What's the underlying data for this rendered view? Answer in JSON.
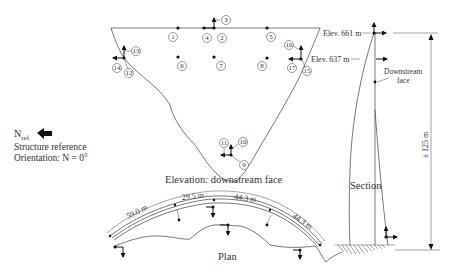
{
  "elevation": {
    "caption": "Elevation: downstream face",
    "gauges": [
      {
        "id": "1",
        "label": "1"
      },
      {
        "id": "2",
        "label": "2"
      },
      {
        "id": "3",
        "label": "3"
      },
      {
        "id": "4",
        "label": "4"
      },
      {
        "id": "5",
        "label": "5"
      },
      {
        "id": "6",
        "label": "6"
      },
      {
        "id": "7",
        "label": "7"
      },
      {
        "id": "8",
        "label": "8"
      },
      {
        "id": "9",
        "label": "9"
      },
      {
        "id": "10",
        "label": "10"
      },
      {
        "id": "11",
        "label": "11"
      },
      {
        "id": "12",
        "label": "12"
      },
      {
        "id": "13",
        "label": "13"
      },
      {
        "id": "14",
        "label": "14"
      },
      {
        "id": "15",
        "label": "15"
      },
      {
        "id": "16",
        "label": "16"
      },
      {
        "id": "17",
        "label": "17"
      }
    ]
  },
  "section": {
    "caption": "Section",
    "elev_top": "Elev. 661 m",
    "elev_mid": "Elev. 637 m",
    "face_label_line1": "Downstream",
    "face_label_line2": "face",
    "height_dim": "± 125 m"
  },
  "plan": {
    "caption": "Plan",
    "dims": [
      "59.0 m",
      "29.5 m",
      "44.3 m",
      "44.3 m"
    ]
  },
  "reference": {
    "north_label": "N",
    "north_subscript": "ref",
    "line1": "Structure reference",
    "line2": "Orientation: N = 0°"
  }
}
